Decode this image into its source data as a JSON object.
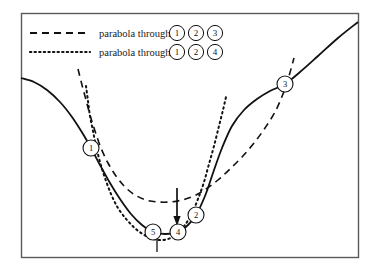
{
  "figure": {
    "background_color": "#ffffff",
    "frame": {
      "stroke_color": "#5a5a5a",
      "x": 21,
      "y": 13,
      "width": 337,
      "height": 244
    }
  },
  "legend": {
    "position": "top-left",
    "entries": [
      {
        "id": "legend-dashed",
        "style": "dashed",
        "label": "parabola through",
        "points": [
          "1",
          "2",
          "3"
        ],
        "color": "#111111",
        "sample_x1": 30,
        "sample_x2": 90,
        "sample_y": 33
      },
      {
        "id": "legend-dotted",
        "style": "dotted",
        "label": "parabola through",
        "points": [
          "1",
          "2",
          "4"
        ],
        "color": "#111111",
        "sample_x1": 30,
        "sample_x2": 90,
        "sample_y": 52
      }
    ]
  },
  "markers": [
    {
      "label": "1",
      "x": 91,
      "y": 148,
      "r": 8
    },
    {
      "label": "2",
      "x": 196,
      "y": 215,
      "r": 8
    },
    {
      "label": "3",
      "x": 285,
      "y": 84,
      "r": 8
    },
    {
      "label": "4",
      "x": 178,
      "y": 232,
      "r": 8
    },
    {
      "label": "5",
      "x": 153,
      "y": 232,
      "r": 8
    }
  ],
  "annotations": [
    {
      "name": "down-arrow",
      "type": "arrow",
      "x": 177,
      "y_start": 188,
      "y_end": 226,
      "direction": "down",
      "color": "#111111"
    },
    {
      "name": "tick-below-point-5",
      "type": "tick",
      "x": 157,
      "y_start": 236,
      "y_end": 252,
      "color": "#111111"
    }
  ],
  "chart_data": {
    "type": "line",
    "xlabel": "",
    "ylabel": "",
    "grid": false,
    "legend_position": "top-left",
    "xlim": [
      21,
      358
    ],
    "ylim": [
      13,
      257
    ],
    "axis_direction": "y-down-pixels",
    "series": [
      {
        "name": "objective function",
        "style": "solid",
        "color": "#111111",
        "width": 1.8,
        "points": [
          [
            21,
            78
          ],
          [
            34,
            82
          ],
          [
            47,
            90
          ],
          [
            60,
            102
          ],
          [
            72,
            117
          ],
          [
            83,
            134
          ],
          [
            91,
            148
          ],
          [
            100,
            165
          ],
          [
            110,
            183
          ],
          [
            120,
            199
          ],
          [
            131,
            214
          ],
          [
            142,
            225
          ],
          [
            153,
            232
          ],
          [
            165,
            234
          ],
          [
            178,
            232
          ],
          [
            188,
            225
          ],
          [
            196,
            215
          ],
          [
            205,
            196
          ],
          [
            213,
            173
          ],
          [
            222,
            148
          ],
          [
            232,
            126
          ],
          [
            244,
            110
          ],
          [
            257,
            99
          ],
          [
            270,
            91
          ],
          [
            285,
            84
          ],
          [
            300,
            72
          ],
          [
            318,
            56
          ],
          [
            338,
            38
          ],
          [
            358,
            22
          ]
        ]
      },
      {
        "name": "parabola through 1 2 3",
        "style": "dashed",
        "color": "#111111",
        "width": 1.6,
        "dasharray": "7,5",
        "points": [
          [
            78,
            69
          ],
          [
            82,
            85
          ],
          [
            86,
            100
          ],
          [
            90,
            115
          ],
          [
            95,
            131
          ],
          [
            101,
            148
          ],
          [
            108,
            163
          ],
          [
            116,
            176
          ],
          [
            125,
            187
          ],
          [
            135,
            195
          ],
          [
            146,
            200
          ],
          [
            158,
            202
          ],
          [
            170,
            202
          ],
          [
            182,
            200
          ],
          [
            194,
            196
          ],
          [
            206,
            189
          ],
          [
            218,
            180
          ],
          [
            230,
            169
          ],
          [
            242,
            157
          ],
          [
            254,
            143
          ],
          [
            265,
            128
          ],
          [
            275,
            112
          ],
          [
            283,
            94
          ],
          [
            289,
            76
          ],
          [
            294,
            58
          ]
        ]
      },
      {
        "name": "parabola through 1 2 4",
        "style": "dotted",
        "color": "#111111",
        "width": 2.0,
        "dasharray": "1.6,3.4",
        "points": [
          [
            86,
            86
          ],
          [
            88,
            101
          ],
          [
            90,
            116
          ],
          [
            93,
            131
          ],
          [
            96,
            146
          ],
          [
            100,
            162
          ],
          [
            105,
            178
          ],
          [
            111,
            194
          ],
          [
            118,
            208
          ],
          [
            127,
            220
          ],
          [
            137,
            230
          ],
          [
            148,
            237
          ],
          [
            158,
            240
          ],
          [
            168,
            239
          ],
          [
            177,
            234
          ],
          [
            185,
            225
          ],
          [
            192,
            213
          ],
          [
            198,
            199
          ],
          [
            204,
            182
          ],
          [
            209,
            164
          ],
          [
            214,
            146
          ],
          [
            219,
            126
          ],
          [
            223,
            110
          ],
          [
            226,
            97
          ]
        ]
      }
    ]
  }
}
